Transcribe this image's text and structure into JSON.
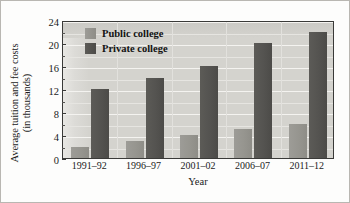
{
  "chart_data": {
    "type": "bar",
    "title": "",
    "xlabel": "Year",
    "ylabel": "Average tuition and fee costs (in thousands)",
    "ylabel_line1": "Average tuition and fee costs",
    "ylabel_line2": "(in thousands)",
    "categories": [
      "1991–92",
      "1996–97",
      "2001–02",
      "2006–07",
      "2011–12"
    ],
    "series": [
      {
        "name": "Public college",
        "values": [
          2,
          3,
          4,
          5,
          6
        ],
        "color": "#96958f"
      },
      {
        "name": "Private college",
        "values": [
          12,
          14,
          16,
          20,
          22
        ],
        "color": "#545350"
      }
    ],
    "ylim": [
      0,
      24
    ],
    "ytick_labels": [
      "0",
      "4",
      "8",
      "12",
      "16",
      "20",
      "24"
    ],
    "ytick_values": [
      0,
      4,
      8,
      12,
      16,
      20,
      24
    ],
    "yminor_values": [
      2,
      6,
      10,
      14,
      18,
      22
    ],
    "grid": true,
    "grid_axis": "y",
    "legend_position": "upper-left-inside",
    "plot_background": "#d4d3ce",
    "gridline_color": "#f4f3f0",
    "axis_color": "#3a3a38"
  }
}
